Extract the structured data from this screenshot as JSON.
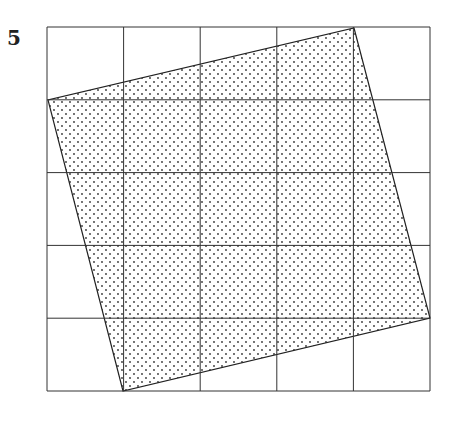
{
  "figure": {
    "label": "5",
    "grid": {
      "cols": 5,
      "rows": 5,
      "x0": 47,
      "y0": 27,
      "cell_w": 76.6,
      "cell_h": 72.8,
      "color": "#333333"
    },
    "square": {
      "vertices": [
        [
          354,
          28
        ],
        [
          430,
          318
        ],
        [
          123,
          391
        ],
        [
          48,
          100
        ]
      ],
      "fill": "dotted",
      "stroke": "#222222"
    }
  }
}
